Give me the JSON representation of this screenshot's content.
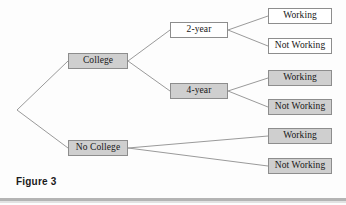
{
  "figure": {
    "caption": "Figure 3",
    "type": "decision-tree-diagram"
  },
  "colors": {
    "gray_fill": "#cfcfcf",
    "white_fill": "#ffffff",
    "border": "#8d8d8d",
    "edge_line": "#9a9a9a",
    "text": "#171717",
    "rule": "#b4b4b4",
    "background": "#fdfdfd"
  },
  "tree": {
    "root": {
      "name": "root-vertex",
      "x": 17,
      "y": 110,
      "has_box": false
    },
    "nodes": [
      {
        "id": "college",
        "label": "College",
        "fill": "gray",
        "x": 68,
        "y": 53,
        "w": 60,
        "h": 16,
        "level": 1
      },
      {
        "id": "no-college",
        "label": "No College",
        "fill": "gray",
        "x": 68,
        "y": 140,
        "w": 60,
        "h": 16,
        "level": 1
      },
      {
        "id": "two-year",
        "label": "2-year",
        "fill": "white",
        "x": 170,
        "y": 22,
        "w": 58,
        "h": 16,
        "level": 2
      },
      {
        "id": "four-year",
        "label": "4-year",
        "fill": "gray",
        "x": 170,
        "y": 83,
        "w": 58,
        "h": 16,
        "level": 2
      },
      {
        "id": "two-year-working",
        "label": "Working",
        "fill": "white",
        "x": 268,
        "y": 8,
        "w": 64,
        "h": 16,
        "level": 3
      },
      {
        "id": "two-year-not-working",
        "label": "Not Working",
        "fill": "white",
        "x": 268,
        "y": 38,
        "w": 64,
        "h": 16,
        "level": 3
      },
      {
        "id": "four-year-working",
        "label": "Working",
        "fill": "gray",
        "x": 268,
        "y": 70,
        "w": 64,
        "h": 16,
        "level": 3
      },
      {
        "id": "four-year-not-working",
        "label": "Not Working",
        "fill": "gray",
        "x": 268,
        "y": 99,
        "w": 64,
        "h": 16,
        "level": 3
      },
      {
        "id": "no-college-working",
        "label": "Working",
        "fill": "gray",
        "x": 268,
        "y": 128,
        "w": 64,
        "h": 16,
        "level": 3
      },
      {
        "id": "no-college-not-working",
        "label": "Not Working",
        "fill": "gray",
        "x": 268,
        "y": 158,
        "w": 64,
        "h": 16,
        "level": 3
      }
    ],
    "edges": [
      {
        "id": "root-to-college",
        "from": "root",
        "to": "college",
        "x1": 17,
        "y1": 110,
        "x2": 68,
        "y2": 61
      },
      {
        "id": "root-to-no-college",
        "from": "root",
        "to": "no-college",
        "x1": 17,
        "y1": 110,
        "x2": 68,
        "y2": 148
      },
      {
        "id": "college-to-2yr",
        "from": "college",
        "to": "two-year",
        "x1": 128,
        "y1": 61,
        "x2": 170,
        "y2": 30
      },
      {
        "id": "college-to-4yr",
        "from": "college",
        "to": "four-year",
        "x1": 128,
        "y1": 61,
        "x2": 170,
        "y2": 91
      },
      {
        "id": "2yr-to-working",
        "from": "two-year",
        "to": "two-year-working",
        "x1": 228,
        "y1": 30,
        "x2": 268,
        "y2": 16
      },
      {
        "id": "2yr-to-not-working",
        "from": "two-year",
        "to": "two-year-not-working",
        "x1": 228,
        "y1": 30,
        "x2": 268,
        "y2": 46
      },
      {
        "id": "4yr-to-working",
        "from": "four-year",
        "to": "four-year-working",
        "x1": 228,
        "y1": 91,
        "x2": 268,
        "y2": 78
      },
      {
        "id": "4yr-to-not-working",
        "from": "four-year",
        "to": "four-year-not-working",
        "x1": 228,
        "y1": 91,
        "x2": 268,
        "y2": 107
      },
      {
        "id": "nc-to-working",
        "from": "no-college",
        "to": "no-college-working",
        "x1": 128,
        "y1": 148,
        "x2": 268,
        "y2": 136
      },
      {
        "id": "nc-to-not-working",
        "from": "no-college",
        "to": "no-college-not-working",
        "x1": 128,
        "y1": 148,
        "x2": 268,
        "y2": 166
      }
    ]
  }
}
